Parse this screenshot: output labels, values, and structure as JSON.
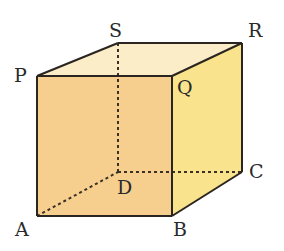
{
  "diagram": {
    "type": "cube",
    "colors": {
      "front": "#F6CF8E",
      "right": "#F9E38C",
      "top": "#FBEDC8",
      "edge": "#2a2520",
      "hidden_edge": "#3a3025"
    },
    "vertices": {
      "P": {
        "label": "P",
        "x": 37,
        "y": 76
      },
      "Q": {
        "label": "Q",
        "x": 172,
        "y": 76
      },
      "R": {
        "label": "R",
        "x": 242,
        "y": 43
      },
      "S": {
        "label": "S",
        "x": 118,
        "y": 43
      },
      "A": {
        "label": "A",
        "x": 37,
        "y": 216
      },
      "B": {
        "label": "B",
        "x": 172,
        "y": 216
      },
      "C": {
        "label": "C",
        "x": 242,
        "y": 172
      },
      "D": {
        "label": "D",
        "x": 118,
        "y": 172
      }
    },
    "labels": {
      "P": "P",
      "Q": "Q",
      "R": "R",
      "S": "S",
      "A": "A",
      "B": "B",
      "C": "C",
      "D": "D"
    },
    "hidden_edges": [
      "AD",
      "DC",
      "SD"
    ],
    "visible_edges": [
      "PQ",
      "QR",
      "RS",
      "SP",
      "PA",
      "AB",
      "BQ",
      "BC",
      "CR"
    ]
  }
}
